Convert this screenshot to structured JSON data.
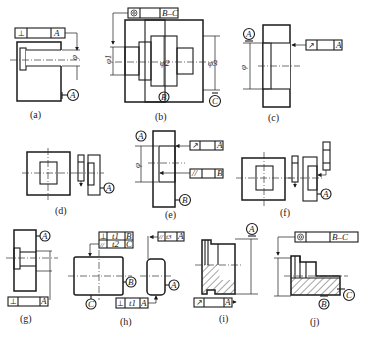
{
  "figure": {
    "panels": [
      {
        "id": "a",
        "caption": "(a)",
        "frame": {
          "symbol": "⊥",
          "symbol_name": "perpendicularity",
          "value": "",
          "datum": "A"
        },
        "datum_label": "A",
        "dimension": "φ"
      },
      {
        "id": "b",
        "caption": "(b)",
        "frame": {
          "symbol": "◎",
          "symbol_name": "coaxiality",
          "value": "",
          "datum": "B–C"
        },
        "datum_labels": [
          "B",
          "C"
        ],
        "dimensions": [
          "φ1",
          "φ2",
          "φ3"
        ]
      },
      {
        "id": "c",
        "caption": "(c)",
        "frame": {
          "symbol": "↗",
          "symbol_name": "circular-runout",
          "value": "",
          "datum": "A"
        },
        "datum_label": "A",
        "dimension": "φ"
      },
      {
        "id": "d",
        "caption": "(d)",
        "frame": {
          "symbol": "⌖",
          "symbol_name": "position",
          "value": "",
          "datum": ""
        },
        "datum_label": "A"
      },
      {
        "id": "e",
        "caption": "(e)",
        "frames": [
          {
            "symbol": "↗",
            "symbol_name": "circular-runout",
            "datum": "A"
          },
          {
            "symbol": "//",
            "symbol_name": "parallelism",
            "datum": "B"
          }
        ],
        "datum_labels": [
          "A",
          "B"
        ],
        "dimension": "φ"
      },
      {
        "id": "f",
        "caption": "(f)",
        "frames": [
          {
            "symbol": "⌖",
            "symbol_name": "position"
          },
          {
            "symbol": "≡",
            "symbol_name": "symmetry"
          }
        ],
        "datum_label": "A"
      },
      {
        "id": "g",
        "caption": "(g)",
        "frame": {
          "symbol": "⊥",
          "symbol_name": "perpendicularity",
          "value": "",
          "datum": "A"
        },
        "datum_label": "A"
      },
      {
        "id": "h",
        "caption": "(h)",
        "frames": [
          {
            "symbol": "⊥",
            "symbol_name": "perpendicularity",
            "value": "t1",
            "datum": "B"
          },
          {
            "symbol": "//",
            "symbol_name": "parallelism",
            "value": "t2",
            "datum": "C"
          },
          {
            "symbol": "//",
            "symbol_name": "parallelism",
            "value": "t3",
            "datum": "A"
          },
          {
            "symbol": "⊥",
            "symbol_name": "perpendicularity",
            "value": "t1",
            "datum": "A"
          }
        ],
        "datum_labels": [
          "B",
          "C",
          "A"
        ]
      },
      {
        "id": "i",
        "caption": "(i)",
        "frame": {
          "symbol": "↗",
          "symbol_name": "circular-runout",
          "value": "",
          "datum": "A"
        },
        "datum_label": "A"
      },
      {
        "id": "j",
        "caption": "(j)",
        "frame": {
          "symbol": "◎",
          "symbol_name": "coaxiality",
          "value": "",
          "datum": "B–C"
        },
        "datum_labels": [
          "B",
          "C"
        ]
      }
    ]
  },
  "colors": {
    "line": "#1a1a1a",
    "background": "#ffffff"
  }
}
